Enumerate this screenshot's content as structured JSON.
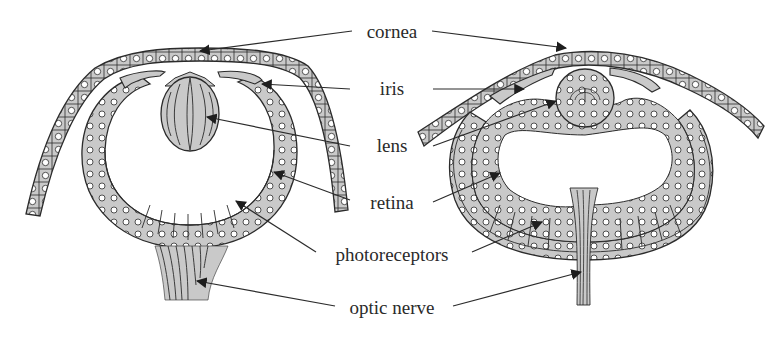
{
  "figure": {
    "type": "comparative anatomy diagram",
    "colors": {
      "background": "#ffffff",
      "tissue_fill": "#c9c9c9",
      "outline": "#2b2b2b",
      "nucleus_fill": "#ffffff",
      "label_text": "#2a2a2a",
      "leader_line": "#2b2b2b"
    }
  },
  "labels": [
    {
      "id": "cornea",
      "text": "cornea",
      "x": 392,
      "y": 31
    },
    {
      "id": "iris",
      "text": "iris",
      "x": 392,
      "y": 88
    },
    {
      "id": "lens",
      "text": "lens",
      "x": 392,
      "y": 145
    },
    {
      "id": "retina",
      "text": "retina",
      "x": 392,
      "y": 202
    },
    {
      "id": "photoreceptors",
      "text": "photoreceptors",
      "x": 392,
      "y": 254
    },
    {
      "id": "optic_nerve",
      "text": "optic nerve",
      "x": 392,
      "y": 307
    }
  ],
  "eyes": [
    {
      "id": "left-eye",
      "description": "eye with photoreceptors facing inward toward lens; optic nerve exits below as broad bundle"
    },
    {
      "id": "right-eye",
      "description": "eye with optic nerve passing through the retina (inverted retina); narrow nerve exits below"
    }
  ]
}
